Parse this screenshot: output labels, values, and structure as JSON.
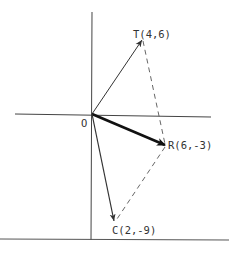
{
  "diagram": {
    "type": "vector-diagram",
    "origin_label": "O",
    "points": [
      {
        "id": "T",
        "label": "T(4,6)",
        "x": 4,
        "y": 6
      },
      {
        "id": "R",
        "label": "R(6,-3)",
        "x": 6,
        "y": -3
      },
      {
        "id": "C",
        "label": "C(2,-9)",
        "x": 2,
        "y": -9
      }
    ],
    "vectors": [
      {
        "from": "O",
        "to": "T",
        "style": "thin-arrow"
      },
      {
        "from": "O",
        "to": "R",
        "style": "bold-arrow"
      },
      {
        "from": "O",
        "to": "C",
        "style": "thin-arrow"
      }
    ],
    "dashed_segments": [
      {
        "from": "T",
        "to": "R"
      },
      {
        "from": "R",
        "to": "C"
      }
    ],
    "colors": {
      "line": "#333333",
      "background": "#ffffff"
    }
  }
}
